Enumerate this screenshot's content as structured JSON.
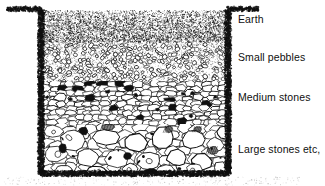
{
  "figure": {
    "type": "cross-section-diagram",
    "background_color": "#ffffff",
    "ink_color": "#101010"
  },
  "labels": {
    "earth": "Earth",
    "small_pebbles": "Small pebbles",
    "medium_stones": "Medium stones",
    "large_stones": "Large stones etc,"
  },
  "layers": [
    {
      "name": "earth",
      "label": "Earth",
      "texture": "dense-stipple",
      "top": 10,
      "bottom": 42
    },
    {
      "name": "small-pebbles",
      "label": "Small pebbles",
      "texture": "small-ellipses",
      "top": 42,
      "bottom": 82
    },
    {
      "name": "medium-stones",
      "label": "Medium stones",
      "texture": "angular-polygons",
      "top": 82,
      "bottom": 125
    },
    {
      "name": "large-stones",
      "label": "Large stones etc,",
      "texture": "large-cobbles",
      "top": 125,
      "bottom": 173
    }
  ],
  "pit": {
    "left_wall_x": 40,
    "right_wall_x": 229,
    "ground_line_y": 9,
    "bottom_y": 175,
    "ground_left_start_x": 7,
    "ground_right_end_x": 259,
    "wall_texture": "rough-stipple-band"
  }
}
